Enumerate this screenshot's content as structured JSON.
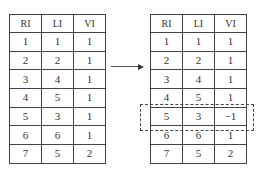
{
  "left_table": {
    "headers": [
      "RI",
      "LI",
      "VI"
    ],
    "rows": [
      [
        "1",
        "1",
        "1"
      ],
      [
        "2",
        "2",
        "1"
      ],
      [
        "3",
        "4",
        "1"
      ],
      [
        "4",
        "5",
        "1"
      ],
      [
        "5",
        "3",
        "1"
      ],
      [
        "6",
        "6",
        "1"
      ],
      [
        "7",
        "5",
        "2"
      ]
    ]
  },
  "right_table": {
    "headers": [
      "RI",
      "LI",
      "VI"
    ],
    "rows": [
      [
        "1",
        "1",
        "1"
      ],
      [
        "2",
        "2",
        "1"
      ],
      [
        "3",
        "4",
        "1"
      ],
      [
        "4",
        "5",
        "1"
      ],
      [
        "5",
        "3",
        "−1"
      ],
      [
        "6",
        "6",
        "1"
      ],
      [
        "7",
        "5",
        "2"
      ]
    ],
    "highlighted_row_index": 4
  },
  "arrow": {
    "direction": "right"
  }
}
